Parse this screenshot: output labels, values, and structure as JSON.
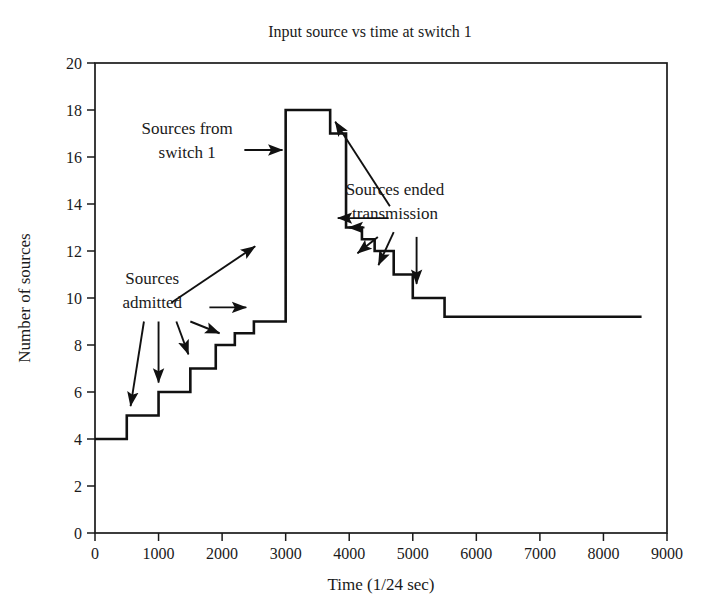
{
  "chart_data": {
    "type": "line",
    "subtype": "step",
    "title": "Input source vs time at switch 1",
    "xlabel": "Time (1/24 sec)",
    "ylabel": "Number of sources",
    "xlim": [
      0,
      9000
    ],
    "ylim": [
      0,
      20
    ],
    "xticks": [
      0,
      1000,
      2000,
      3000,
      4000,
      5000,
      6000,
      7000,
      8000,
      9000
    ],
    "yticks": [
      0,
      2,
      4,
      6,
      8,
      10,
      12,
      14,
      16,
      18,
      20
    ],
    "xtick_labels": [
      "0",
      "1000",
      "2000",
      "3000",
      "4000",
      "5000",
      "6000",
      "7000",
      "8000",
      "9000"
    ],
    "ytick_labels": [
      "0",
      "2",
      "4",
      "6",
      "8",
      "10",
      "12",
      "14",
      "16",
      "18",
      "20"
    ],
    "grid": false,
    "legend": "none",
    "line_color": "#111111",
    "series": [
      {
        "name": "Sources at switch 1",
        "step_mode": "post",
        "x": [
          0,
          500,
          1000,
          1500,
          1900,
          2200,
          2500,
          3000,
          3700,
          3950,
          4200,
          4400,
          4700,
          5000,
          5500,
          8600
        ],
        "y": [
          4,
          5,
          6,
          7,
          8,
          8.5,
          9,
          18,
          17,
          13,
          12.5,
          12,
          11,
          10,
          9.2,
          9.2
        ]
      }
    ],
    "annotations": [
      {
        "id": "sources-from-switch-1",
        "text_lines": [
          "Sources from",
          "switch 1"
        ],
        "text_x": 1450,
        "text_y": 17.0,
        "arrows": [
          {
            "from_x": 2350,
            "from_y": 16.3,
            "to_x": 2950,
            "to_y": 16.3
          }
        ]
      },
      {
        "id": "sources-admitted",
        "text_lines": [
          "Sources",
          "admitted"
        ],
        "text_x": 900,
        "text_y": 10.6,
        "arrows": [
          {
            "from_x": 1200,
            "from_y": 9.8,
            "to_x": 2520,
            "to_y": 12.2
          },
          {
            "from_x": 1800,
            "from_y": 9.6,
            "to_x": 2380,
            "to_y": 9.6
          },
          {
            "from_x": 1500,
            "from_y": 9.0,
            "to_x": 1960,
            "to_y": 8.5
          },
          {
            "from_x": 1280,
            "from_y": 9.0,
            "to_x": 1470,
            "to_y": 7.6
          },
          {
            "from_x": 1000,
            "from_y": 9.0,
            "to_x": 1000,
            "to_y": 6.4
          },
          {
            "from_x": 770,
            "from_y": 9.0,
            "to_x": 560,
            "to_y": 5.4
          }
        ]
      },
      {
        "id": "sources-ended-transmission",
        "text_lines": [
          "Sources ended",
          "transmission"
        ],
        "text_x": 4720,
        "text_y": 14.4,
        "arrows": [
          {
            "from_x": 4640,
            "from_y": 13.9,
            "to_x": 3780,
            "to_y": 17.5
          },
          {
            "from_x": 4620,
            "from_y": 13.4,
            "to_x": 3820,
            "to_y": 13.4
          },
          {
            "from_x": 4240,
            "from_y": 13.0,
            "to_x": 3990,
            "to_y": 13.0
          },
          {
            "from_x": 4450,
            "from_y": 12.6,
            "to_x": 4130,
            "to_y": 11.9
          },
          {
            "from_x": 4700,
            "from_y": 12.8,
            "to_x": 4460,
            "to_y": 11.4
          },
          {
            "from_x": 5060,
            "from_y": 12.6,
            "to_x": 5060,
            "to_y": 10.6
          }
        ]
      }
    ]
  }
}
